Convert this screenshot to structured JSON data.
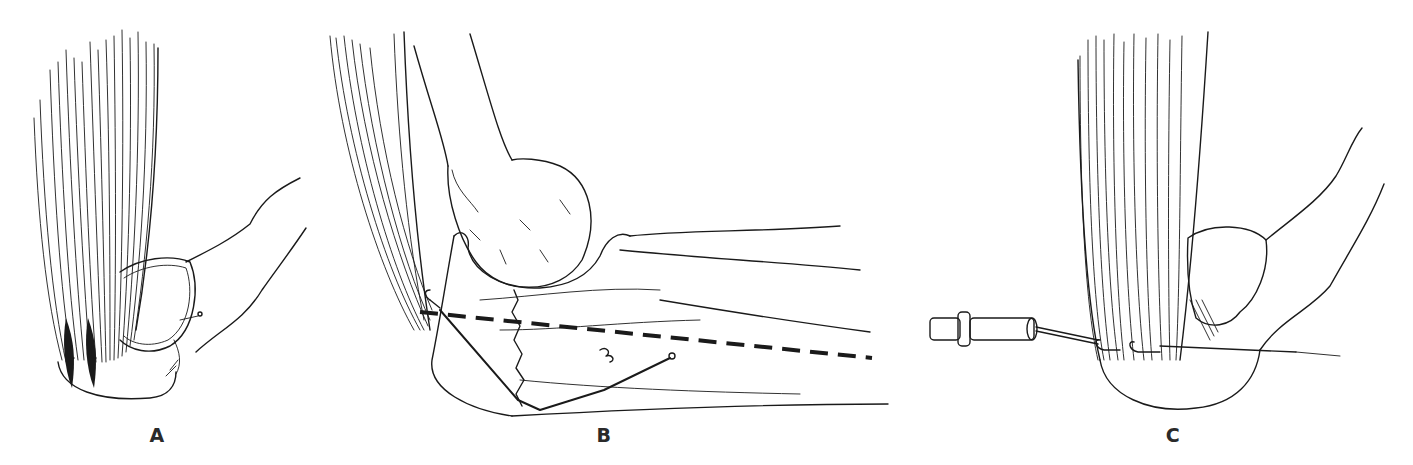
{
  "figure": {
    "panels": [
      {
        "id": "A",
        "label": "A",
        "label_x": 157,
        "label_y": 424
      },
      {
        "id": "B",
        "label": "B",
        "label_x": 604,
        "label_y": 424
      },
      {
        "id": "C",
        "label": "C",
        "label_x": 1173,
        "label_y": 424
      }
    ],
    "colors": {
      "ink": "#1a1a1a",
      "background": "#ffffff"
    }
  }
}
